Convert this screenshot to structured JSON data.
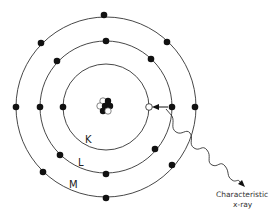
{
  "diagram": {
    "shells": [
      {
        "label": "K",
        "radius": 43,
        "electrons": 2
      },
      {
        "label": "L",
        "radius": 66,
        "electrons": 8
      },
      {
        "label": "M",
        "radius": 90,
        "electrons": 8
      }
    ],
    "nucleus": {
      "description": "cluster of protons and neutrons"
    },
    "vacancy": {
      "shell": "K",
      "description": "hole in K shell filled by L-shell electron"
    },
    "caption": {
      "line1": "Characteristic",
      "line2": "x-ray"
    },
    "colors": {
      "line": "#333333",
      "electron": "#111111",
      "background": "#ffffff"
    }
  }
}
